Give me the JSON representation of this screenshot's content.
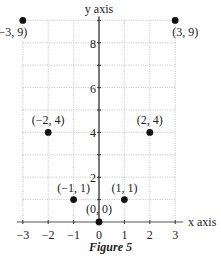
{
  "figure": {
    "caption": "Figure 5"
  },
  "chart_data": {
    "type": "scatter",
    "title": "",
    "xlabel": "x axis",
    "ylabel": "y axis",
    "xlim": [
      -3,
      3
    ],
    "ylim": [
      0,
      9
    ],
    "grid": true,
    "x_ticks": [
      -3,
      -2,
      -1,
      0,
      1,
      2,
      3
    ],
    "y_ticks_labeled": [
      2,
      4,
      6,
      8
    ],
    "points": [
      {
        "x": -3,
        "y": 9,
        "label": "(−3, 9)"
      },
      {
        "x": -2,
        "y": 4,
        "label": "(−2, 4)"
      },
      {
        "x": -1,
        "y": 1,
        "label": "(−1, 1)"
      },
      {
        "x": 0,
        "y": 0,
        "label": "(0, 0)"
      },
      {
        "x": 1,
        "y": 1,
        "label": "(1, 1)"
      },
      {
        "x": 2,
        "y": 4,
        "label": "(2, 4)"
      },
      {
        "x": 3,
        "y": 9,
        "label": "(3, 9)"
      }
    ],
    "colors": {
      "point": "#111111",
      "axis": "#555555",
      "grid": "#bbbbbb"
    }
  }
}
